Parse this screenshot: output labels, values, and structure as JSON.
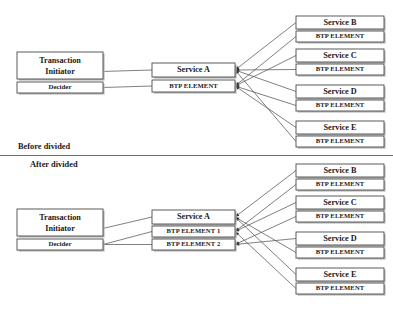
{
  "diagram": {
    "type": "block-diagram",
    "colors": {
      "background": "#ffffff",
      "box_border": "#4a4a4a",
      "box_fill": "#ffffff",
      "box_shadow": "#b9b9b9",
      "connector": "#555555",
      "text": "#1a1a1a",
      "divider": "#6e6e6e"
    },
    "sections": [
      {
        "id": "before",
        "caption": "Before divided",
        "caption_pos": {
          "x": 18,
          "y": 147
        },
        "initiator": {
          "title": "Transaction Initiator",
          "line1": "Transaction",
          "line2": "Initiator",
          "box": {
            "x": 17,
            "y": 52,
            "w": 86,
            "h": 27
          },
          "sub": {
            "label": "Decider",
            "box": {
              "x": 17,
              "y": 82,
              "h": 11,
              "w": 86
            }
          }
        },
        "hub": {
          "title": "Service A",
          "box": {
            "x": 152,
            "y": 63,
            "w": 83,
            "h": 14
          },
          "elements": [
            {
              "label": "BTP ELEMENT",
              "box": {
                "x": 152,
                "y": 80,
                "w": 83,
                "h": 12
              }
            }
          ]
        },
        "services": [
          {
            "title": "Service B",
            "box": {
              "x": 296,
              "y": 16,
              "w": 88,
              "h": 13
            },
            "element": {
              "label": "BTP ELEMENT",
              "box": {
                "x": 296,
                "y": 31,
                "w": 88,
                "h": 11
              }
            }
          },
          {
            "title": "Service C",
            "box": {
              "x": 296,
              "y": 49,
              "w": 88,
              "h": 13
            },
            "element": {
              "label": "BTP ELEMENT",
              "box": {
                "x": 296,
                "y": 64,
                "w": 88,
                "h": 11
              }
            }
          },
          {
            "title": "Service D",
            "box": {
              "x": 296,
              "y": 85,
              "w": 88,
              "h": 13
            },
            "element": {
              "label": "BTP ELEMENT",
              "box": {
                "x": 296,
                "y": 100,
                "w": 88,
                "h": 11
              }
            }
          },
          {
            "title": "Service E",
            "box": {
              "x": 296,
              "y": 121,
              "w": 88,
              "h": 13
            },
            "element": {
              "label": "BTP ELEMENT",
              "box": {
                "x": 296,
                "y": 136,
                "w": 88,
                "h": 11
              }
            }
          }
        ]
      },
      {
        "id": "after",
        "caption": "After divided",
        "caption_pos": {
          "x": 30,
          "y": 165
        },
        "initiator": {
          "title": "Transaction Initiator",
          "line1": "Transaction",
          "line2": "Initiator",
          "box": {
            "x": 17,
            "y": 209,
            "w": 86,
            "h": 27
          },
          "sub": {
            "label": "Decider",
            "box": {
              "x": 17,
              "y": 239,
              "h": 11,
              "w": 86
            }
          }
        },
        "hub": {
          "title": "Service A",
          "box": {
            "x": 152,
            "y": 210,
            "w": 83,
            "h": 14
          },
          "elements": [
            {
              "label": "BTP ELEMENT 1",
              "box": {
                "x": 152,
                "y": 226,
                "w": 83,
                "h": 11
              }
            },
            {
              "label": "BTP ELEMENT 2",
              "box": {
                "x": 152,
                "y": 239,
                "w": 83,
                "h": 11
              }
            }
          ]
        },
        "services": [
          {
            "title": "Service B",
            "box": {
              "x": 296,
              "y": 164,
              "w": 88,
              "h": 13
            },
            "element": {
              "label": "BTP ELEMENT",
              "box": {
                "x": 296,
                "y": 179,
                "w": 88,
                "h": 11
              }
            }
          },
          {
            "title": "Service C",
            "box": {
              "x": 296,
              "y": 196,
              "w": 88,
              "h": 13
            },
            "element": {
              "label": "BTP ELEMENT",
              "box": {
                "x": 296,
                "y": 211,
                "w": 88,
                "h": 11
              }
            }
          },
          {
            "title": "Service D",
            "box": {
              "x": 296,
              "y": 232,
              "w": 88,
              "h": 13
            },
            "element": {
              "label": "BTP ELEMENT",
              "box": {
                "x": 296,
                "y": 247,
                "w": 88,
                "h": 11
              }
            }
          },
          {
            "title": "Service E",
            "box": {
              "x": 296,
              "y": 268,
              "w": 88,
              "h": 13
            },
            "element": {
              "label": "BTP ELEMENT",
              "box": {
                "x": 296,
                "y": 283,
                "w": 88,
                "h": 11
              }
            }
          }
        ]
      }
    ],
    "divider": {
      "x1": 0,
      "y1": 155.5,
      "x2": 393,
      "y2": 155.5
    }
  }
}
